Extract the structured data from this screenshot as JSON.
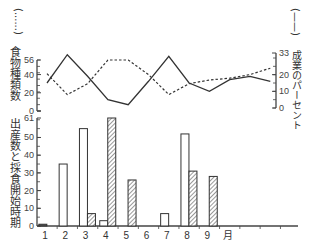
{
  "chart_data": [
    {
      "type": "line",
      "title": "",
      "x": [
        1,
        2,
        3,
        4,
        5,
        6,
        7,
        8,
        9,
        10,
        11,
        12
      ],
      "ylabel_left": "食物種類数",
      "ylabel_right": "成業のパーセント",
      "left_axis": {
        "ticks": [
          0,
          20,
          40,
          56
        ],
        "ylim": [
          0,
          56
        ]
      },
      "right_axis": {
        "ticks": [
          0,
          10,
          20,
          33
        ],
        "ylim": [
          0,
          33
        ]
      },
      "legend": [
        {
          "name": "食物種類数",
          "style": "dashed",
          "marker": "(......)"
        },
        {
          "name": "成業のパーセント",
          "style": "solid",
          "marker": "(——)"
        }
      ],
      "series": [
        {
          "name": "食物種類数",
          "axis": "left",
          "style": "dashed",
          "values": [
            41,
            18,
            30,
            56,
            56,
            40,
            18,
            30,
            34,
            36,
            40,
            47
          ]
        },
        {
          "name": "成業のパーセント",
          "axis": "right",
          "style": "solid",
          "values": [
            15,
            32,
            19,
            5,
            2,
            16,
            31,
            15,
            10,
            17,
            19,
            16
          ]
        }
      ],
      "grid": false
    },
    {
      "type": "bar",
      "title": "",
      "categories": [
        "1",
        "2",
        "3",
        "4",
        "5",
        "6",
        "7",
        "8",
        "9"
      ],
      "xlabel": "月",
      "ylabel": "出産数と採食開始時期",
      "ylim": [
        0,
        61
      ],
      "yticks": [
        0,
        10,
        20,
        30,
        40,
        50,
        61
      ],
      "series": [
        {
          "name": "出産数",
          "fill": "white",
          "values": [
            1,
            35,
            55,
            3,
            0,
            0,
            7,
            52,
            0
          ]
        },
        {
          "name": "採食開始時期",
          "fill": "hatched",
          "values": [
            0,
            0,
            7,
            61,
            26,
            0,
            0,
            31,
            28
          ]
        }
      ],
      "grid": false
    }
  ],
  "labels": {
    "left_top_marker": "(......)",
    "left_top_title": "食物種類数",
    "right_top_marker": "(——)",
    "right_top_title": "成業のパーセント",
    "bottom_left_title": "出産数と採食開始時期",
    "month_unit": "月"
  },
  "ticks": {
    "top_left": [
      "56",
      "40",
      "20",
      "0"
    ],
    "top_right": [
      "33",
      "20",
      "10",
      "0"
    ],
    "bottom_left": [
      "61",
      "50",
      "40",
      "30",
      "20",
      "10",
      "0"
    ],
    "months": [
      "1",
      "2",
      "3",
      "4",
      "5",
      "6",
      "7",
      "8",
      "9"
    ]
  },
  "colors": {
    "line": "#333333",
    "axis": "#444444",
    "hatch": "#555555",
    "background": "#ffffff"
  }
}
